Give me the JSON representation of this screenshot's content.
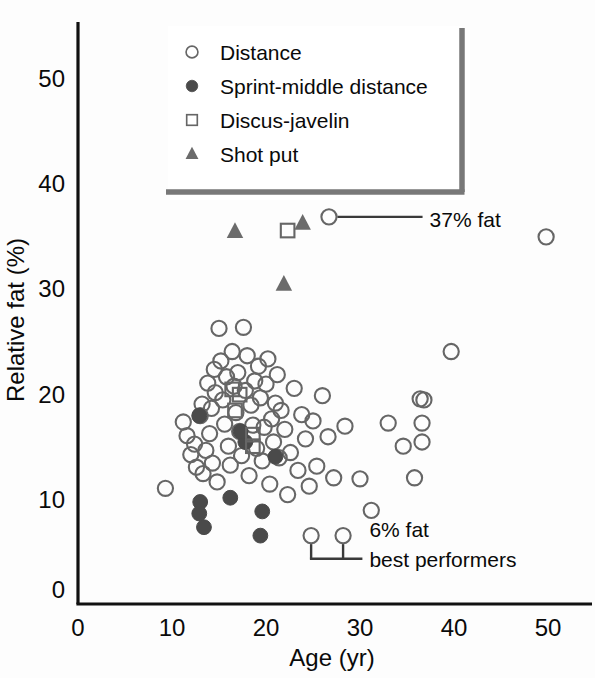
{
  "chart_data": {
    "type": "scatter",
    "title": "",
    "xlabel": "Age (yr)",
    "ylabel": "Relative fat (%)",
    "xlim": [
      0,
      54
    ],
    "ylim": [
      0,
      55
    ],
    "xticks": [
      0,
      10,
      20,
      30,
      40,
      50
    ],
    "yticks": [
      0,
      10,
      20,
      30,
      40,
      50
    ],
    "xtick_labels": [
      "0",
      "10",
      "20",
      "30",
      "40",
      "50"
    ],
    "ytick_labels": [
      "0",
      "10",
      "20",
      "30",
      "40",
      "50"
    ],
    "grid": false,
    "legend_position": "top-right",
    "series": [
      {
        "name": "Distance",
        "marker": "open-circle",
        "color": "#555555",
        "points": [
          [
            9.3,
            11.0
          ],
          [
            11.2,
            17.3
          ],
          [
            11.6,
            16.0
          ],
          [
            12.0,
            14.2
          ],
          [
            12.4,
            15.2
          ],
          [
            12.6,
            13.0
          ],
          [
            13.0,
            17.9
          ],
          [
            13.2,
            19.0
          ],
          [
            13.3,
            12.4
          ],
          [
            13.6,
            14.6
          ],
          [
            13.8,
            21.0
          ],
          [
            14.0,
            16.2
          ],
          [
            14.2,
            18.6
          ],
          [
            14.3,
            13.4
          ],
          [
            14.5,
            22.3
          ],
          [
            14.6,
            20.1
          ],
          [
            14.8,
            11.6
          ],
          [
            15.0,
            26.2
          ],
          [
            15.2,
            23.1
          ],
          [
            15.4,
            19.4
          ],
          [
            15.6,
            17.1
          ],
          [
            15.8,
            21.6
          ],
          [
            16.0,
            15.0
          ],
          [
            16.2,
            13.2
          ],
          [
            16.4,
            24.0
          ],
          [
            16.6,
            20.7
          ],
          [
            16.8,
            18.2
          ],
          [
            17.0,
            22.0
          ],
          [
            17.2,
            16.4
          ],
          [
            17.4,
            14.1
          ],
          [
            17.6,
            26.3
          ],
          [
            17.8,
            20.3
          ],
          [
            18.0,
            23.6
          ],
          [
            18.2,
            12.2
          ],
          [
            18.4,
            18.9
          ],
          [
            18.6,
            17.0
          ],
          [
            18.8,
            21.2
          ],
          [
            19.0,
            14.8
          ],
          [
            19.2,
            22.6
          ],
          [
            19.4,
            19.6
          ],
          [
            19.6,
            13.6
          ],
          [
            19.8,
            16.8
          ],
          [
            20.0,
            20.9
          ],
          [
            20.2,
            23.3
          ],
          [
            20.4,
            11.4
          ],
          [
            20.6,
            17.6
          ],
          [
            20.8,
            15.4
          ],
          [
            21.0,
            19.1
          ],
          [
            21.2,
            21.8
          ],
          [
            21.4,
            13.9
          ],
          [
            21.6,
            18.4
          ],
          [
            22.0,
            16.6
          ],
          [
            22.3,
            10.4
          ],
          [
            22.6,
            14.4
          ],
          [
            23.0,
            20.5
          ],
          [
            23.4,
            12.7
          ],
          [
            23.8,
            18.0
          ],
          [
            24.2,
            15.7
          ],
          [
            24.6,
            11.2
          ],
          [
            25.0,
            17.4
          ],
          [
            25.4,
            13.1
          ],
          [
            26.0,
            19.8
          ],
          [
            26.6,
            15.9
          ],
          [
            27.2,
            12.0
          ],
          [
            28.4,
            16.9
          ],
          [
            30.0,
            11.9
          ],
          [
            31.2,
            8.9
          ],
          [
            33.0,
            17.2
          ],
          [
            34.6,
            15.0
          ],
          [
            35.8,
            12.0
          ],
          [
            36.4,
            19.5
          ],
          [
            36.8,
            19.4
          ],
          [
            36.6,
            17.2
          ],
          [
            36.6,
            15.4
          ],
          [
            39.7,
            24.0
          ],
          [
            49.8,
            34.9
          ],
          [
            26.7,
            36.8
          ],
          [
            24.8,
            6.5
          ],
          [
            28.2,
            6.5
          ]
        ]
      },
      {
        "name": "Sprint-middle distance",
        "marker": "filled-circle",
        "color": "#4a4a4a",
        "points": [
          [
            12.9,
            17.9
          ],
          [
            13.0,
            9.7
          ],
          [
            12.9,
            8.6
          ],
          [
            13.4,
            7.3
          ],
          [
            16.2,
            10.1
          ],
          [
            17.8,
            15.4
          ],
          [
            17.3,
            16.4
          ],
          [
            19.6,
            8.8
          ],
          [
            19.4,
            6.5
          ],
          [
            21.0,
            14.0
          ]
        ]
      },
      {
        "name": "Discus-javelin",
        "marker": "open-square",
        "color": "#555555",
        "points": [
          [
            16.4,
            20.4
          ],
          [
            16.7,
            18.4
          ],
          [
            17.2,
            19.9
          ],
          [
            18.6,
            16.1
          ],
          [
            18.6,
            15.0
          ],
          [
            22.3,
            35.5
          ]
        ]
      },
      {
        "name": "Shot put",
        "marker": "filled-triangle",
        "color": "#686868",
        "points": [
          [
            16.7,
            35.4
          ],
          [
            23.9,
            36.2
          ],
          [
            21.9,
            30.4
          ]
        ]
      }
    ],
    "annotations": [
      {
        "id": "fat-37",
        "text": "37% fat",
        "target_point": [
          26.7,
          36.8
        ],
        "text_x": 37.4,
        "text_y": 36.6
      },
      {
        "id": "fat-6",
        "text": "6% fat",
        "target_points": [
          [
            24.8,
            6.5
          ],
          [
            28.2,
            6.5
          ]
        ],
        "text_x": 31.0,
        "text_y": 7.1
      },
      {
        "id": "best-performers",
        "text": "best performers",
        "text_x": 31.0,
        "text_y": 4.3
      }
    ]
  },
  "legend": {
    "items": [
      {
        "label": "Distance",
        "marker": "open-circle"
      },
      {
        "label": "Sprint-middle distance",
        "marker": "filled-circle"
      },
      {
        "label": "Discus-javelin",
        "marker": "open-square"
      },
      {
        "label": "Shot put",
        "marker": "filled-triangle"
      }
    ]
  },
  "colors": {
    "axis": "#111111",
    "marker_outline": "#666666",
    "marker_fill_dark": "#4a4a4a",
    "triangle_fill": "#6b6b6b",
    "legend_border": "#777777",
    "annotation_line": "#3a3a3a",
    "background": "#fdfdfd"
  }
}
